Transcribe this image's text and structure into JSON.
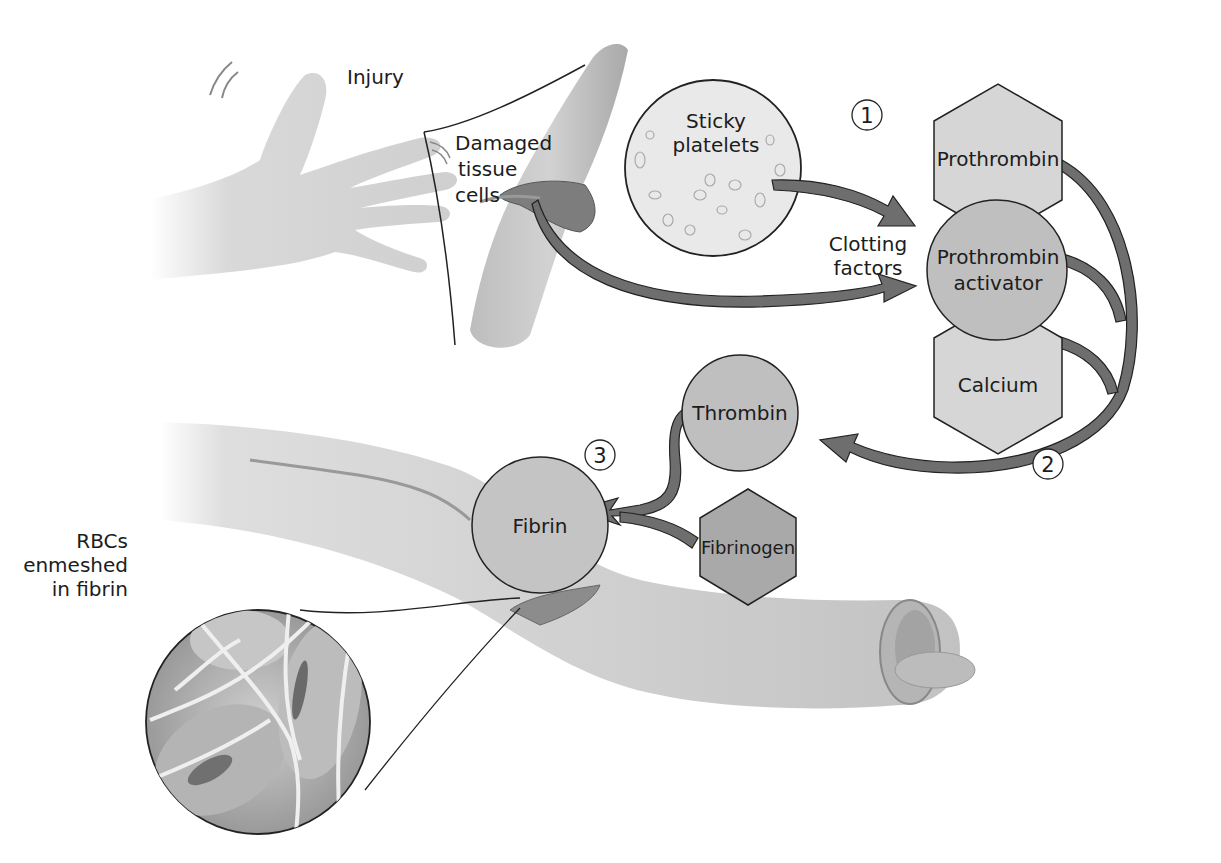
{
  "diagram": {
    "type": "blood-clotting-process",
    "labels": {
      "injury": "Injury",
      "damaged_tissue": [
        "Damaged",
        "tissue",
        "cells"
      ],
      "sticky_platelets": [
        "Sticky",
        "platelets"
      ],
      "clotting_factors": [
        "Clotting",
        "factors"
      ],
      "rbcs": [
        "RBCs",
        "enmeshed",
        "in fibrin"
      ]
    },
    "molecules": {
      "prothrombin": "Prothrombin",
      "prothrombin_activator": [
        "Prothrombin",
        "activator"
      ],
      "calcium": "Calcium",
      "thrombin": "Thrombin",
      "fibrinogen": "Fibrinogen",
      "fibrin": "Fibrin"
    },
    "steps": [
      "1",
      "2",
      "3"
    ],
    "colors": {
      "hexagon_fill": "#d6d6d6",
      "circle_fill": "#bfbfbf",
      "fibrinogen_fill": "#a9a9a9",
      "arrow_fill": "#6e6e6e",
      "outline": "#222222",
      "vessel_fill": "#c9c9c9",
      "skin_fill": "#d8d8d8"
    }
  }
}
